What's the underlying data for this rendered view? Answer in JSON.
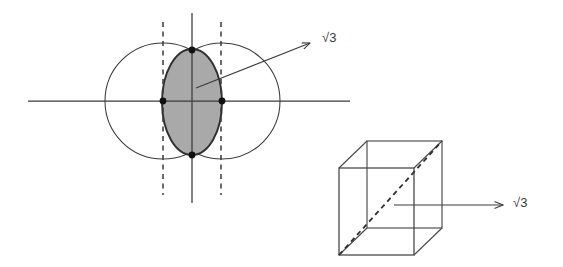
{
  "figure": {
    "background_color": "#ffffff",
    "width": 563,
    "height": 267
  },
  "labels": {
    "lens_sqrt3": "√3",
    "cube_sqrt3": "√3"
  },
  "colors": {
    "stroke": "#3a3a3a",
    "lens_fill": "#a9a9a9",
    "lens_stroke": "#2f2f2f",
    "point_fill": "#111111",
    "dashed_stroke": "#3a3a3a",
    "cube_stroke": "#4a4a4a"
  },
  "left_diagram": {
    "name": "two-circles-lens",
    "x_axis": {
      "x1": 28,
      "y1": 101,
      "x2": 350,
      "y2": 101
    },
    "y_axis": {
      "x1": 192,
      "y1": 13,
      "x2": 192,
      "y2": 203
    },
    "circles": [
      {
        "name": "left-circle",
        "cx": 163,
        "cy": 101,
        "r": 58
      },
      {
        "name": "right-circle",
        "cx": 222,
        "cy": 101,
        "r": 58
      }
    ],
    "lens": {
      "cx": 192,
      "cy": 102,
      "rx": 30,
      "ry": 53
    },
    "dashed_lines": [
      {
        "name": "left-dashed-line",
        "x": 163,
        "y1": 22,
        "y2": 195
      },
      {
        "name": "right-dashed-line",
        "x": 221,
        "y1": 22,
        "y2": 195
      }
    ],
    "points": [
      {
        "name": "top-intersection-point",
        "x": 192,
        "y": 50
      },
      {
        "name": "bottom-intersection-point",
        "x": 192,
        "y": 155
      },
      {
        "name": "left-center-point",
        "x": 163,
        "y": 101
      },
      {
        "name": "right-center-point",
        "x": 222,
        "y": 101
      }
    ],
    "arrow": {
      "name": "lens-sqrt3-arrow",
      "x1": 196,
      "y1": 88,
      "x2": 312,
      "y2": 42
    }
  },
  "right_diagram": {
    "name": "wireframe-cube",
    "front_face": {
      "x": 339,
      "y": 168,
      "width": 75,
      "height": 87
    },
    "depth_offset": {
      "dx": 28,
      "dy": -27
    },
    "space_diagonal": {
      "name": "cube-space-diagonal",
      "x1": 339,
      "y1": 255,
      "x2": 470,
      "y2": 141,
      "style": "dashed"
    },
    "arrow": {
      "name": "cube-sqrt3-arrow",
      "x1": 394,
      "y1": 205,
      "x2": 505,
      "y2": 205
    }
  }
}
